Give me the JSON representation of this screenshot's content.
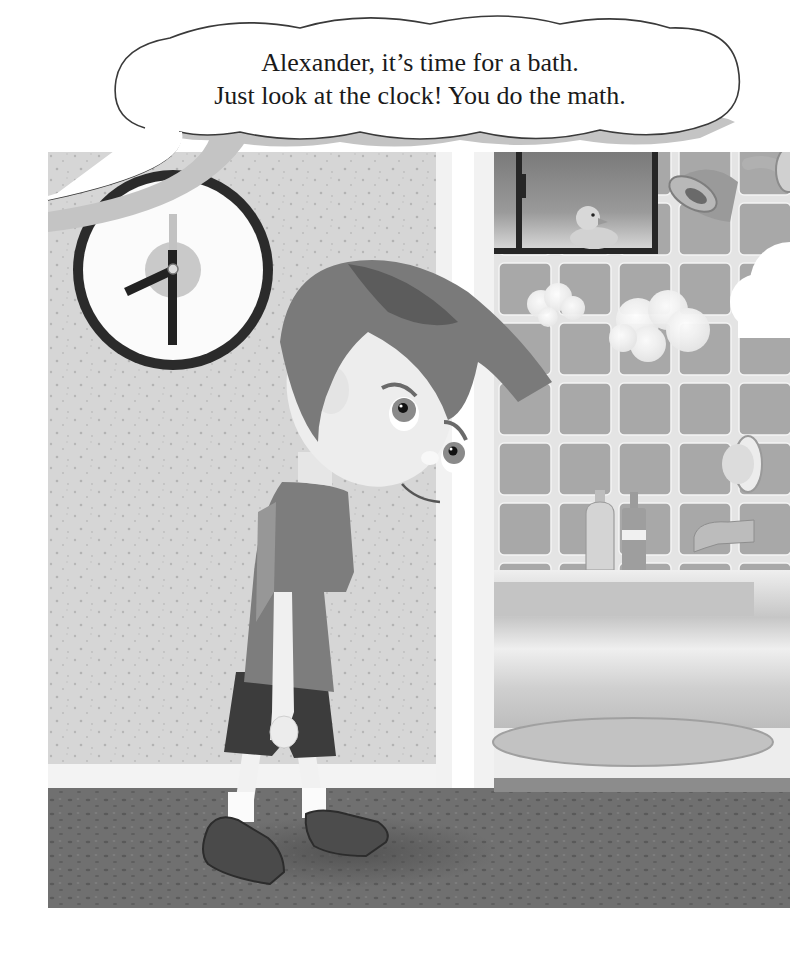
{
  "speech_bubble": {
    "speaker": "off-panel narrator (parent)",
    "lines": [
      "Alexander, it’s time for a bath.",
      "Just look at the clock!  You do the math."
    ]
  },
  "scene": {
    "description": "Boy walking reluctantly past a wall clock toward a bathroom with running shower",
    "character": {
      "name": "Alexander",
      "expression": "sad / reluctant",
      "clothing": [
        "t-shirt",
        "shorts",
        "white socks",
        "sneakers"
      ]
    },
    "clock": {
      "time_shown": "7:30",
      "hour_hand_angle_deg": 225,
      "minute_hand_angle_deg": 180
    },
    "bathroom_items": [
      "window with rubber duck",
      "shower head",
      "steam clouds",
      "tiled wall",
      "shampoo bottle",
      "soap bottle",
      "faucet",
      "tap handle",
      "bathtub",
      "round bath mat"
    ]
  },
  "colors": {
    "wall": "#d4d4d4",
    "wall_speckle": "#b8b8b8",
    "door_frame": "#f2f2f2",
    "tile": "#a9a9a9",
    "grout": "#e6e6e6",
    "carpet": "#6e6e6e",
    "clock_rim": "#2b2b2b",
    "bubble_shadow": "#c4c4c4",
    "text": "#1a1a1a"
  }
}
